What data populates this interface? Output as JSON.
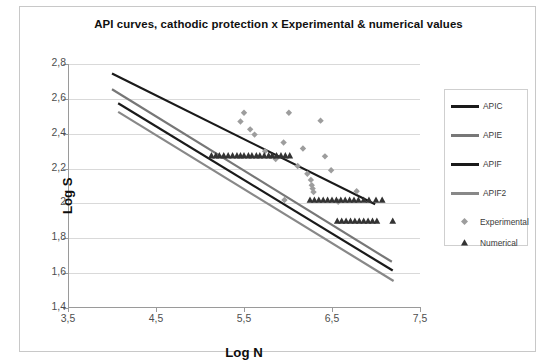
{
  "chart_data": {
    "type": "line",
    "title": "API curves, cathodic protection x Experimental & numerical values",
    "xlabel": "Log N",
    "ylabel": "Log S",
    "xlim": [
      3.5,
      7.5
    ],
    "ylim": [
      1.4,
      2.8
    ],
    "xticks": [
      "3,5",
      "4,5",
      "5,5",
      "6,5",
      "7,5"
    ],
    "xtick_values": [
      3.5,
      4.5,
      5.5,
      6.5,
      7.5
    ],
    "yticks": [
      "1,4",
      "1,6",
      "1,8",
      "2",
      "2,2",
      "2,4",
      "2,6",
      "2,8"
    ],
    "ytick_values": [
      1.4,
      1.6,
      1.8,
      2.0,
      2.2,
      2.4,
      2.6,
      2.8
    ],
    "grid": "horizontal",
    "legend_position": "right",
    "series": [
      {
        "name": "APIC",
        "type": "line",
        "color": "#1a1a1a",
        "width": 2.2,
        "points": [
          [
            4.0,
            2.745
          ],
          [
            6.99,
            1.995
          ]
        ]
      },
      {
        "name": "APIE",
        "type": "line",
        "color": "#777777",
        "width": 2.2,
        "points": [
          [
            4.0,
            2.655
          ],
          [
            7.18,
            1.665
          ]
        ]
      },
      {
        "name": "APIF",
        "type": "line",
        "color": "#1a1a1a",
        "width": 2.2,
        "points": [
          [
            4.07,
            2.575
          ],
          [
            7.19,
            1.615
          ]
        ]
      },
      {
        "name": "APIF2",
        "type": "line",
        "color": "#888888",
        "width": 2.2,
        "points": [
          [
            4.07,
            2.525
          ],
          [
            7.2,
            1.555
          ]
        ]
      },
      {
        "name": "Experimental",
        "type": "scatter",
        "marker": "diamond",
        "color": "#9d9d9d",
        "points": [
          [
            5.46,
            2.47
          ],
          [
            5.5,
            2.52
          ],
          [
            5.57,
            2.425
          ],
          [
            5.62,
            2.395
          ],
          [
            5.74,
            2.3
          ],
          [
            5.86,
            2.255
          ],
          [
            5.95,
            2.35
          ],
          [
            6.01,
            2.52
          ],
          [
            6.11,
            2.215
          ],
          [
            6.17,
            2.315
          ],
          [
            6.22,
            2.17
          ],
          [
            6.26,
            2.135
          ],
          [
            6.27,
            2.105
          ],
          [
            6.28,
            2.085
          ],
          [
            6.29,
            2.065
          ],
          [
            6.37,
            2.475
          ],
          [
            6.42,
            2.27
          ],
          [
            6.49,
            2.19
          ],
          [
            6.78,
            2.07
          ],
          [
            6.57,
            2.01
          ],
          [
            5.96,
            2.02
          ]
        ]
      },
      {
        "name": "Numerical",
        "type": "scatter",
        "marker": "triangle",
        "color": "#333333",
        "points": [
          [
            5.13,
            2.275
          ],
          [
            5.18,
            2.275
          ],
          [
            5.22,
            2.275
          ],
          [
            5.27,
            2.275
          ],
          [
            5.32,
            2.275
          ],
          [
            5.37,
            2.275
          ],
          [
            5.42,
            2.275
          ],
          [
            5.46,
            2.275
          ],
          [
            5.5,
            2.275
          ],
          [
            5.55,
            2.275
          ],
          [
            5.59,
            2.275
          ],
          [
            5.64,
            2.275
          ],
          [
            5.68,
            2.275
          ],
          [
            5.73,
            2.275
          ],
          [
            5.78,
            2.275
          ],
          [
            5.82,
            2.275
          ],
          [
            5.87,
            2.275
          ],
          [
            5.92,
            2.275
          ],
          [
            5.97,
            2.275
          ],
          [
            6.02,
            2.275
          ],
          [
            6.25,
            2.02
          ],
          [
            6.3,
            2.02
          ],
          [
            6.35,
            2.02
          ],
          [
            6.4,
            2.02
          ],
          [
            6.45,
            2.02
          ],
          [
            6.5,
            2.02
          ],
          [
            6.55,
            2.02
          ],
          [
            6.6,
            2.02
          ],
          [
            6.65,
            2.02
          ],
          [
            6.7,
            2.02
          ],
          [
            6.75,
            2.02
          ],
          [
            6.8,
            2.02
          ],
          [
            6.86,
            2.02
          ],
          [
            6.92,
            2.02
          ],
          [
            7.0,
            2.02
          ],
          [
            7.07,
            2.02
          ],
          [
            6.56,
            1.9
          ],
          [
            6.61,
            1.9
          ],
          [
            6.66,
            1.9
          ],
          [
            6.71,
            1.9
          ],
          [
            6.76,
            1.9
          ],
          [
            6.81,
            1.9
          ],
          [
            6.86,
            1.9
          ],
          [
            6.91,
            1.9
          ],
          [
            6.96,
            1.9
          ],
          [
            7.01,
            1.9
          ],
          [
            7.19,
            1.9
          ]
        ]
      }
    ]
  },
  "legend": {
    "items": [
      {
        "label": "APIC"
      },
      {
        "label": "APIE"
      },
      {
        "label": "APIF"
      },
      {
        "label": "APIF2"
      },
      {
        "label": "Experimental"
      },
      {
        "label": "Numerical"
      }
    ]
  }
}
